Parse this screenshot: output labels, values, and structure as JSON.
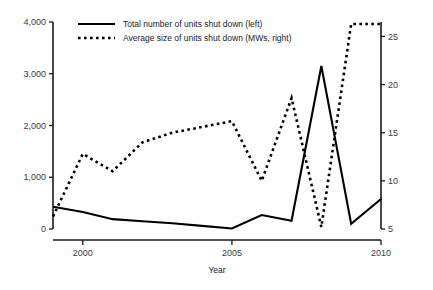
{
  "chart_data": {
    "type": "line",
    "title": "",
    "xlabel": "Year",
    "x": [
      1999,
      2000,
      2001,
      2002,
      2003,
      2004,
      2005,
      2006,
      2007,
      2008,
      2009,
      2010
    ],
    "x_tick_labels": [
      "2000",
      "2005",
      "2010"
    ],
    "x_ticks": [
      2000,
      2005,
      2010
    ],
    "xlim": [
      1999,
      2010
    ],
    "grid": false,
    "legend_position": "top-center",
    "axes": [
      {
        "id": "left",
        "ylabel": "",
        "ylim": [
          0,
          4000
        ],
        "tick_values": [
          0,
          1000,
          2000,
          3000,
          4000
        ],
        "tick_labels": [
          "0",
          "1,000",
          "2,000",
          "3,000",
          "4,000"
        ]
      },
      {
        "id": "right",
        "ylabel": "",
        "ylim": [
          5,
          26.5
        ],
        "tick_values": [
          5,
          10,
          15,
          20,
          25
        ],
        "tick_labels": [
          "5",
          "10",
          "15",
          "20",
          "25"
        ]
      }
    ],
    "series": [
      {
        "name": "Total number of units shut down (left)",
        "axis": "left",
        "style": "solid",
        "color": "#000000",
        "values": [
          430,
          330,
          190,
          150,
          110,
          60,
          10,
          270,
          160,
          3150,
          100,
          580
        ]
      },
      {
        "name": "Average size of units shut down (MWs, right)",
        "axis": "right",
        "style": "dotted",
        "color": "#000000",
        "values": [
          6.3,
          12.8,
          11.0,
          14.0,
          15.0,
          15.6,
          16.2,
          10.0,
          18.6,
          5.2,
          26.3,
          26.3
        ]
      }
    ]
  },
  "legend": {
    "entries": [
      {
        "label": "Total number of units shut down (left)",
        "style": "solid"
      },
      {
        "label": "Average size of units shut down (MWs, right)",
        "style": "dotted"
      }
    ]
  }
}
